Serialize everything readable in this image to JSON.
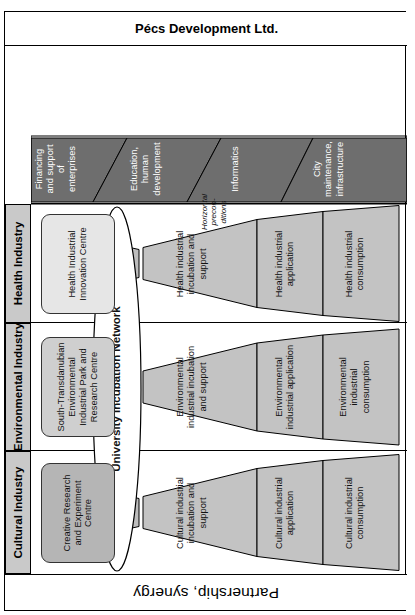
{
  "diagram": {
    "title": "Partnership, synergy",
    "footer": "Pécs Development Ltd.",
    "center_network": "University Incubation Network",
    "research_note": "Research, Innovation",
    "horizontal_note": "Horizontal precon-\nditions",
    "colors": {
      "header_gray": "#c9c9c9",
      "funnel_gray": "#c3c3c3",
      "column_gray": "#bdbdbd",
      "dark_gray": "#6e6e6e",
      "centre_gray": "#b5b5b5",
      "centre_light": "#e6e6e6",
      "outline": "#000000",
      "white_text": "#ffffff"
    },
    "industries": [
      {
        "header": "Cultural Industry",
        "centre": "Creative Research and Experiment Centre",
        "centre_fill": "#b5b5b5",
        "stages": [
          "Cultural industrial incubation and support",
          "Cultural industrial application",
          "Cultural industrial consumption"
        ]
      },
      {
        "header": "Environmental Industry",
        "centre": "South-Transdanubian Environmental Industrial Park and Research Centre",
        "centre_fill": "#cfcfcf",
        "stages": [
          "Environmental industrial incubation and support",
          "Environmental industrial application",
          "Environmental industrial consumption"
        ]
      },
      {
        "header": "Health Industry",
        "centre": "Health Industrial Innovation Centre",
        "centre_fill": "#e6e6e6",
        "stages": [
          "Health industrial incubation and support",
          "Health industrial application",
          "Health industrial consumption"
        ]
      }
    ],
    "preconditions": [
      "Financing and support of enterprises",
      "Education, human development",
      "Informatics",
      "City maintenance, infrastructure"
    ]
  }
}
